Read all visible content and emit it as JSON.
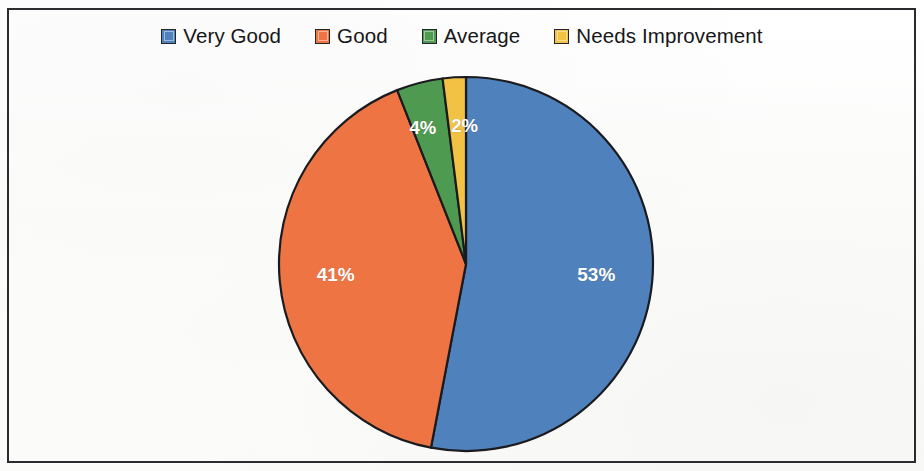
{
  "chart_data": {
    "type": "pie",
    "title": "",
    "subtitle": "",
    "xlabel": "",
    "ylabel": "",
    "legend_position": "top-center",
    "grid": false,
    "start_angle_deg": 0,
    "direction": "clockwise",
    "categories": [
      "Very Good",
      "Good",
      "Average",
      "Needs Improvement"
    ],
    "values": [
      53,
      41,
      4,
      2
    ],
    "value_unit": "%",
    "data_labels": [
      "53%",
      "41%",
      "4%",
      "2%"
    ],
    "colors": [
      "#4F81BD",
      "#EE7543",
      "#4E9A51",
      "#F2C244"
    ],
    "slice_order_clockwise_from_top": [
      {
        "label": "Very Good",
        "value": 53,
        "data_label": "53%",
        "color": "#4F81BD"
      },
      {
        "label": "Good",
        "value": 41,
        "data_label": "41%",
        "color": "#EE7543"
      },
      {
        "label": "Average",
        "value": 4,
        "data_label": "4%",
        "color": "#4E9A51"
      },
      {
        "label": "Needs Improvement",
        "value": 2,
        "data_label": "2%",
        "color": "#F2C244"
      }
    ]
  },
  "legend": {
    "items": [
      {
        "label": "Very Good",
        "color": "#4F81BD",
        "swatch_name": "legend-swatch-very-good"
      },
      {
        "label": "Good",
        "color": "#EE7543",
        "swatch_name": "legend-swatch-good"
      },
      {
        "label": "Average",
        "color": "#4E9A51",
        "swatch_name": "legend-swatch-average"
      },
      {
        "label": "Needs Improvement",
        "color": "#F2C244",
        "swatch_name": "legend-swatch-needs-improvement"
      }
    ]
  },
  "pie": {
    "labels": {
      "very_good": "53%",
      "good": "41%",
      "average": "4%",
      "needs_improvement": "2%"
    }
  },
  "style": {
    "border_color": "#2b2b2f",
    "background": "#ffffff",
    "slice_outline": "#1b1b1f",
    "label_color": "#ffffff"
  }
}
